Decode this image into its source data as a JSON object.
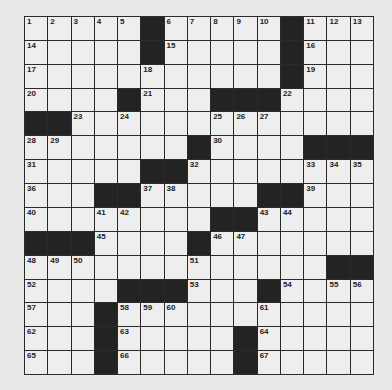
{
  "puzzle": {
    "rows": 15,
    "cols": 15,
    "colors": {
      "background": "#e9e9e9",
      "cell": "#eeeeee",
      "block": "#232323",
      "line": "#2a2a2a"
    },
    "layout": [
      "11111#11111#111",
      "00000#00000#100",
      "10000100000#100",
      "1000#100###1000",
      "##10100011100000",
      "110000#1000###",
      "10000##10000111",
      "100##110000##100",
      "10011000##11000",
      "###1000#11000000",
      "1110000100000##",
      "1000###100#1011",
      "100#1110001000000",
      "100#10000#10000",
      "100#10000#10000"
    ],
    "grid": [
      [
        "1",
        "2",
        "3",
        "4",
        "5",
        "#",
        "6",
        "7",
        "8",
        "9",
        "10",
        "#",
        "11",
        "12",
        "13"
      ],
      [
        "14",
        "",
        "",
        "",
        "",
        "#",
        "15",
        "",
        "",
        "",
        "",
        "#",
        "16",
        "",
        ""
      ],
      [
        "17",
        "",
        "",
        "",
        "",
        "18",
        "",
        "",
        "",
        "",
        "",
        "#",
        "19",
        "",
        ""
      ],
      [
        "20",
        "",
        "",
        "",
        "#",
        "21",
        "",
        "",
        "#",
        "#",
        "#",
        "22",
        "",
        "",
        ""
      ],
      [
        "#",
        "#",
        "23",
        "",
        "24",
        "",
        "",
        "",
        "25",
        "26",
        "27",
        "",
        "",
        "",
        ""
      ],
      [
        "28",
        "29",
        "",
        "",
        "",
        "",
        "",
        "#",
        "30",
        "",
        "",
        "",
        "#",
        "#",
        "#"
      ],
      [
        "31",
        "",
        "",
        "",
        "",
        "#",
        "#",
        "32",
        "",
        "",
        "",
        "",
        "33",
        "34",
        "35"
      ],
      [
        "36",
        "",
        "",
        "#",
        "#",
        "37",
        "38",
        "",
        "",
        "",
        "#",
        "#",
        "39",
        "",
        ""
      ],
      [
        "40",
        "",
        "",
        "41",
        "42",
        "",
        "",
        "",
        "#",
        "#",
        "43",
        "44",
        "",
        "",
        ""
      ],
      [
        "#",
        "#",
        "#",
        "45",
        "",
        "",
        "",
        "#",
        "46",
        "47",
        "",
        "",
        "",
        "",
        ""
      ],
      [
        "48",
        "49",
        "50",
        "",
        "",
        "",
        "",
        "51",
        "",
        "",
        "",
        "",
        "",
        "#",
        "#"
      ],
      [
        "52",
        "",
        "",
        "",
        "#",
        "#",
        "#",
        "53",
        "",
        "",
        "#",
        "54",
        "",
        "55",
        "56"
      ],
      [
        "57",
        "",
        "",
        "#",
        "58",
        "59",
        "60",
        "",
        "",
        "",
        "61",
        "",
        "",
        "",
        ""
      ],
      [
        "62",
        "",
        "",
        "#",
        "63",
        "",
        "",
        "",
        "",
        "#",
        "64",
        "",
        "",
        "",
        ""
      ],
      [
        "65",
        "",
        "",
        "#",
        "66",
        "",
        "",
        "",
        "",
        "#",
        "67",
        "",
        "",
        "",
        ""
      ]
    ]
  }
}
